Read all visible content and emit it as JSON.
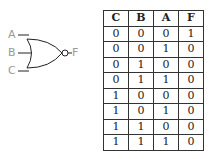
{
  "gate": {
    "type": "NOR",
    "inputs": [
      "A",
      "B",
      "C"
    ],
    "output": "F"
  },
  "truth_table": {
    "headers": [
      "C",
      "B",
      "A",
      "F"
    ],
    "rows": [
      [
        "0",
        "0",
        "0",
        "1"
      ],
      [
        "0",
        "0",
        "1",
        "0"
      ],
      [
        "0",
        "1",
        "0",
        "0"
      ],
      [
        "0",
        "1",
        "1",
        "0"
      ],
      [
        "1",
        "0",
        "0",
        "0"
      ],
      [
        "1",
        "0",
        "1",
        "0"
      ],
      [
        "1",
        "1",
        "0",
        "0"
      ],
      [
        "1",
        "1",
        "1",
        "0"
      ]
    ]
  }
}
